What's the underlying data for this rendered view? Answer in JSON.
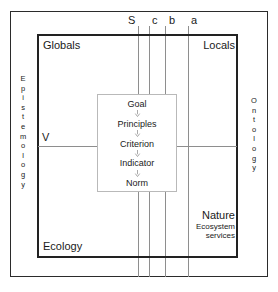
{
  "diagram": {
    "axis_labels": [
      {
        "label": "S",
        "x": 131
      },
      {
        "label": "c",
        "x": 152
      },
      {
        "label": "b",
        "x": 168
      },
      {
        "label": "a",
        "x": 191
      }
    ],
    "vertical_lines_x": [
      138,
      149,
      165,
      188
    ],
    "corners": {
      "top_left": "Globals",
      "top_right": "Locals",
      "bottom_left": "Ecology",
      "bottom_right_title": "Nature",
      "bottom_right_subtitle": "Ecosystem\nservices"
    },
    "bottom_right_sub_line1": "Ecosystem",
    "bottom_right_sub_line2": "services",
    "v_label": "V",
    "left_axis": "Epistemology",
    "right_axis": "Ontology",
    "chain": [
      "Goal",
      "Principles",
      "Criterion",
      "Indicator",
      "Norm"
    ],
    "colors": {
      "frame_dark": "#222222",
      "frame_outer": "#2b2b2b",
      "grid_line": "#8e8e8e",
      "chain_box_border": "#b9b9b9",
      "arrow": "#aaaaaa",
      "text": "#1a1a1a",
      "background": "#ffffff"
    }
  }
}
